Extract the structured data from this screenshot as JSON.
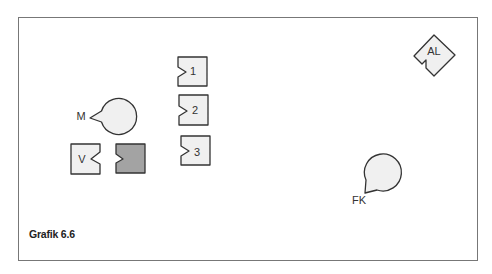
{
  "caption": "Grafik 6.6",
  "colors": {
    "shape_fill": "#f0f0f0",
    "shape_fill_dark": "#a3a3a3",
    "stroke": "#333333",
    "frame": "#777777"
  },
  "nodes": [
    {
      "id": "M",
      "label": "M",
      "shape": "circle-notch"
    },
    {
      "id": "V",
      "label": "V",
      "shape": "square-notch"
    },
    {
      "id": "dark",
      "label": "",
      "shape": "square-notch-left",
      "filled": true
    },
    {
      "id": "1",
      "label": "1",
      "shape": "square-notch-left"
    },
    {
      "id": "2",
      "label": "2",
      "shape": "square-notch-left"
    },
    {
      "id": "3",
      "label": "3",
      "shape": "square-notch-left"
    },
    {
      "id": "AL",
      "label": "AL",
      "shape": "diamond-notch"
    },
    {
      "id": "FK",
      "label": "FK",
      "shape": "circle-notch"
    }
  ]
}
